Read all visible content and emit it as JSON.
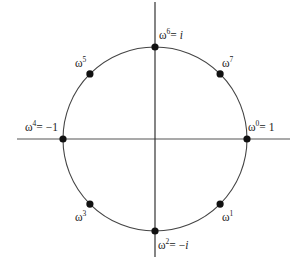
{
  "diagram": {
    "center": [
      155,
      139
    ],
    "radius": 92,
    "axes": {
      "x": {
        "from": [
          17,
          139
        ],
        "to": [
          290,
          139
        ],
        "color": "#555555"
      },
      "y": {
        "from": [
          155,
          2
        ],
        "to": [
          155,
          257
        ],
        "color": "#333333"
      }
    },
    "circle_color": "#444444",
    "point_color": "#111111",
    "points": [
      {
        "id": "w0",
        "angle_deg": 0,
        "base": "ω",
        "exp": "0",
        "suffix": "= 1",
        "suffix_italic": false,
        "label_pos": [
          248,
          122
        ]
      },
      {
        "id": "w1",
        "angle_deg": -45,
        "base": "ω",
        "exp": "1",
        "suffix": "",
        "suffix_italic": false,
        "label_pos": [
          222,
          212
        ]
      },
      {
        "id": "w2",
        "angle_deg": -90,
        "base": "ω",
        "exp": "2",
        "suffix": "= −i",
        "suffix_italic": true,
        "label_pos": [
          158,
          240
        ]
      },
      {
        "id": "w3",
        "angle_deg": -135,
        "base": "ω",
        "exp": "3",
        "suffix": "",
        "suffix_italic": false,
        "label_pos": [
          75,
          212
        ]
      },
      {
        "id": "w4",
        "angle_deg": 180,
        "base": "ω",
        "exp": "4",
        "suffix": "= −1",
        "suffix_italic": false,
        "label_pos": [
          25,
          122
        ]
      },
      {
        "id": "w5",
        "angle_deg": 135,
        "base": "ω",
        "exp": "5",
        "suffix": "",
        "suffix_italic": false,
        "label_pos": [
          75,
          58
        ]
      },
      {
        "id": "w6",
        "angle_deg": 90,
        "base": "ω",
        "exp": "6",
        "suffix": "= i",
        "suffix_italic": true,
        "label_pos": [
          159,
          30
        ]
      },
      {
        "id": "w7",
        "angle_deg": 45,
        "base": "ω",
        "exp": "7",
        "suffix": "",
        "suffix_italic": false,
        "label_pos": [
          222,
          58
        ]
      }
    ]
  }
}
